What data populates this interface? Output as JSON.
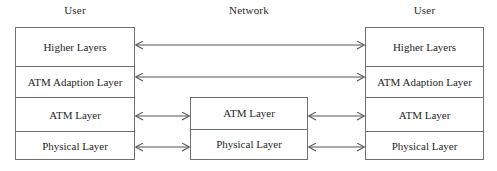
{
  "diagram": {
    "title_row": {
      "left": "User",
      "middle": "Network",
      "right": "User"
    },
    "colors": {
      "border": "#6f6f6f",
      "arrow": "#545454",
      "text": "#1f1f1f",
      "background": "#ffffff"
    },
    "user_left_stack": {
      "layers": [
        {
          "label": "Higher  Layers"
        },
        {
          "label": "ATM Adaption Layer"
        },
        {
          "label": "ATM Layer"
        },
        {
          "label": "Physical Layer"
        }
      ]
    },
    "network_stack": {
      "layers": [
        {
          "label": "ATM Layer"
        },
        {
          "label": "Physical Layer"
        }
      ]
    },
    "user_right_stack": {
      "layers": [
        {
          "label": "Higher  Layers"
        },
        {
          "label": "ATM Adaption Layer"
        },
        {
          "label": "ATM Layer"
        },
        {
          "label": "Physical Layer"
        }
      ]
    },
    "connections": [
      {
        "name": "higher-layers-link",
        "from": "user-left",
        "to": "user-right",
        "style": "double-headed"
      },
      {
        "name": "aal-link",
        "from": "user-left",
        "to": "user-right",
        "style": "double-headed"
      },
      {
        "name": "atm-left-link",
        "from": "user-left",
        "to": "network",
        "style": "double-headed"
      },
      {
        "name": "atm-right-link",
        "from": "network",
        "to": "user-right",
        "style": "double-headed"
      },
      {
        "name": "physical-left-link",
        "from": "user-left",
        "to": "network",
        "style": "double-headed"
      },
      {
        "name": "physical-right-link",
        "from": "network",
        "to": "user-right",
        "style": "double-headed"
      }
    ]
  }
}
